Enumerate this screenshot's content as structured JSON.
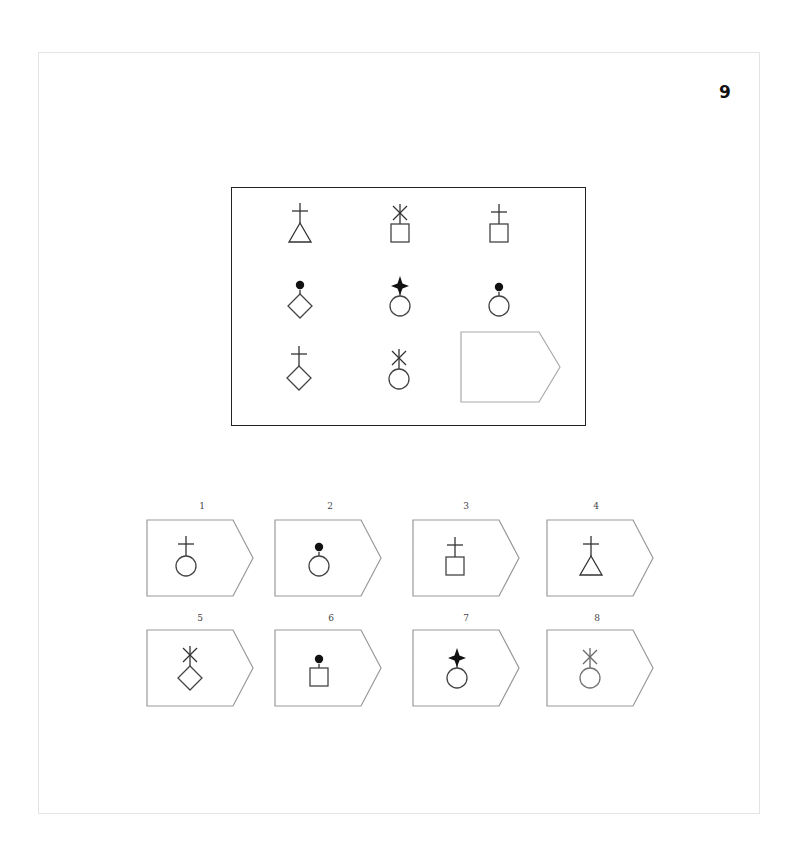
{
  "page": {
    "number": "9"
  },
  "matrix": {
    "rows": 3,
    "cols": 3,
    "cells": [
      {
        "row": 1,
        "col": 1,
        "top_symbol": "cross",
        "bottom_shape": "triangle"
      },
      {
        "row": 1,
        "col": 2,
        "top_symbol": "asterisk",
        "bottom_shape": "square"
      },
      {
        "row": 1,
        "col": 3,
        "top_symbol": "cross",
        "bottom_shape": "square"
      },
      {
        "row": 2,
        "col": 1,
        "top_symbol": "dot",
        "bottom_shape": "diamond"
      },
      {
        "row": 2,
        "col": 2,
        "top_symbol": "four-point-star",
        "bottom_shape": "circle"
      },
      {
        "row": 2,
        "col": 3,
        "top_symbol": "dot",
        "bottom_shape": "circle"
      },
      {
        "row": 3,
        "col": 1,
        "top_symbol": "cross",
        "bottom_shape": "diamond"
      },
      {
        "row": 3,
        "col": 2,
        "top_symbol": "asterisk",
        "bottom_shape": "circle"
      },
      {
        "row": 3,
        "col": 3,
        "top_symbol": "empty",
        "bottom_shape": "empty-answer-slot"
      }
    ]
  },
  "options": [
    {
      "label": "1",
      "top_symbol": "cross",
      "bottom_shape": "circle"
    },
    {
      "label": "2",
      "top_symbol": "dot",
      "bottom_shape": "circle"
    },
    {
      "label": "3",
      "top_symbol": "cross",
      "bottom_shape": "square"
    },
    {
      "label": "4",
      "top_symbol": "cross",
      "bottom_shape": "triangle"
    },
    {
      "label": "5",
      "top_symbol": "asterisk",
      "bottom_shape": "diamond"
    },
    {
      "label": "6",
      "top_symbol": "dot",
      "bottom_shape": "square"
    },
    {
      "label": "7",
      "top_symbol": "four-point-star",
      "bottom_shape": "circle"
    },
    {
      "label": "8",
      "top_symbol": "asterisk",
      "bottom_shape": "circle"
    }
  ],
  "colors": {
    "ink": "#222222",
    "light_ink": "#888888",
    "frame": "#e4e4e4"
  }
}
